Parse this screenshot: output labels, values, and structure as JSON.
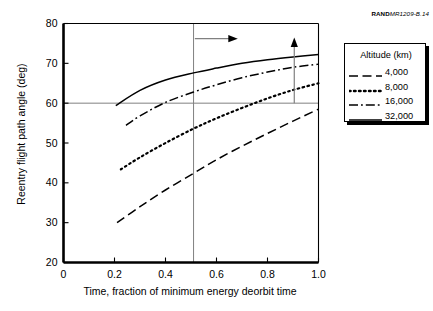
{
  "credit": {
    "bold": "RAND",
    "italic": "MR1209-B.14"
  },
  "legend": {
    "title": "Altitude (km)",
    "entries": [
      {
        "label": "4,000",
        "style": "dashed"
      },
      {
        "label": "8,000",
        "style": "dotted"
      },
      {
        "label": "16,000",
        "style": "dashdot"
      },
      {
        "label": "32,000",
        "style": "solid"
      }
    ]
  },
  "chart_data": {
    "type": "line",
    "title": "",
    "xlabel": "Time, fraction of minimum energy deorbit time",
    "ylabel": "Reentry flight path angle (deg)",
    "xlim": [
      0,
      1.0
    ],
    "ylim": [
      20,
      80
    ],
    "xticks": [
      "0",
      "0.2",
      "0.4",
      "0.6",
      "0.8",
      "1.0"
    ],
    "xtick_values": [
      0,
      0.2,
      0.4,
      0.6,
      0.8,
      1.0
    ],
    "yticks": [
      "20",
      "30",
      "40",
      "50",
      "60",
      "70",
      "80"
    ],
    "ytick_values": [
      20,
      30,
      40,
      50,
      60,
      70,
      80
    ],
    "grid": false,
    "legend_position": "right",
    "reference_lines": [
      {
        "name": "vertical-reference-line",
        "orientation": "vertical",
        "value": 0.51
      },
      {
        "name": "horizontal-reference-line",
        "orientation": "horizontal",
        "value": 60
      }
    ],
    "annotations": [
      {
        "name": "horizontal-arrow",
        "type": "arrow",
        "from": [
          0.515,
          76.2
        ],
        "to": [
          0.66,
          76.2
        ]
      },
      {
        "name": "vertical-arrow",
        "type": "arrow",
        "from": [
          0.905,
          60.0
        ],
        "to": [
          0.905,
          75.0
        ]
      }
    ],
    "series": [
      {
        "name": "4,000",
        "style": "dashed",
        "x": [
          0.21,
          0.3,
          0.4,
          0.51,
          0.6,
          0.7,
          0.8,
          0.9,
          1.0
        ],
        "values": [
          30.0,
          34.0,
          38.2,
          42.4,
          45.8,
          49.2,
          52.4,
          55.5,
          58.5
        ]
      },
      {
        "name": "8,000",
        "style": "dotted",
        "x": [
          0.225,
          0.3,
          0.4,
          0.51,
          0.6,
          0.7,
          0.8,
          0.9,
          1.0
        ],
        "values": [
          43.4,
          46.4,
          50.0,
          53.6,
          56.2,
          58.8,
          61.2,
          63.3,
          65.0
        ]
      },
      {
        "name": "16,000",
        "style": "dashdot",
        "x": [
          0.245,
          0.3,
          0.4,
          0.51,
          0.6,
          0.7,
          0.8,
          0.9,
          1.0
        ],
        "values": [
          54.4,
          56.8,
          60.2,
          62.8,
          64.6,
          66.4,
          67.8,
          69.0,
          69.8
        ]
      },
      {
        "name": "32,000",
        "style": "solid",
        "x": [
          0.205,
          0.3,
          0.4,
          0.51,
          0.6,
          0.7,
          0.8,
          0.9,
          1.0
        ],
        "values": [
          59.4,
          63.2,
          65.8,
          67.6,
          68.8,
          70.0,
          70.9,
          71.6,
          72.2
        ]
      }
    ]
  }
}
